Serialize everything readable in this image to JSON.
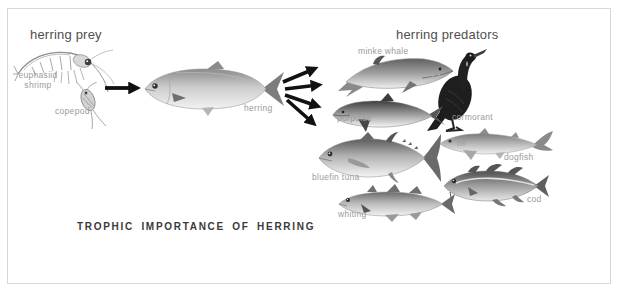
{
  "title": "TROPHIC IMPORTANCE OF HERRING",
  "prey_section": {
    "header": "herring prey",
    "items": [
      {
        "label": "euphasiid shrimp"
      },
      {
        "label": "copepod"
      }
    ]
  },
  "herring": {
    "label": "herring"
  },
  "predator_section": {
    "header": "herring predators",
    "items": [
      {
        "label": "minke whale"
      },
      {
        "label": "porpoise"
      },
      {
        "label": "cormorant"
      },
      {
        "label": "bluefin tuna"
      },
      {
        "label": "dogfish"
      },
      {
        "label": "whiting"
      },
      {
        "label": "cod"
      }
    ]
  },
  "colors": {
    "background": "#ffffff",
    "frame_border": "#d6d6d6",
    "header_text": "#4f4f4f",
    "label_text": "#9b9b9b",
    "title_text": "#3a3a3a",
    "arrow": "#111111"
  }
}
